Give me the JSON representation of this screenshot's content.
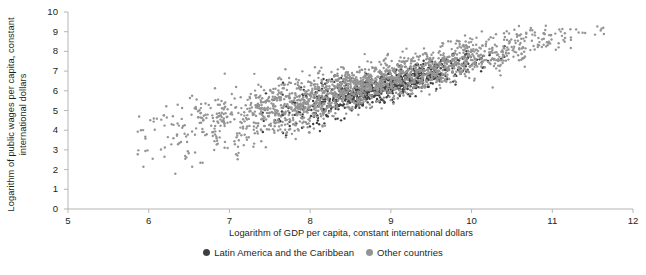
{
  "chart_data": {
    "type": "scatter",
    "title": "",
    "xlabel": "Logarithm of GDP per capita, constant international dollars",
    "ylabel": "Logarithm of public wages per capita, constant international dollars",
    "xlim": [
      5,
      12
    ],
    "ylim": [
      0,
      10
    ],
    "xticks": [
      5,
      6,
      7,
      8,
      9,
      10,
      11,
      12
    ],
    "yticks": [
      0,
      1,
      2,
      3,
      4,
      5,
      6,
      7,
      8,
      9,
      10
    ],
    "grid": false,
    "legend_position": "bottom-center",
    "marker_size_px": 2.4,
    "series": [
      {
        "name": "Latin America and the Caribbean",
        "color": "#3f3f3f",
        "n_points": 760,
        "x_range": [
          7.35,
          10.45
        ],
        "y_range": [
          3.7,
          8.3
        ],
        "trend_slope": 1.12,
        "trend_intercept": -3.75,
        "scatter_sd": 0.33,
        "x_mean": 8.85,
        "x_sd": 0.62
      },
      {
        "name": "Other countries",
        "color": "#949494",
        "n_points": 1850,
        "x_range": [
          5.85,
          11.8
        ],
        "y_range": [
          1.4,
          9.3
        ],
        "trend_slope": 1.05,
        "trend_intercept": -2.85,
        "scatter_sd": 0.52,
        "x_mean": 8.6,
        "x_sd": 1.25
      }
    ]
  },
  "axis": {
    "x_tick_labels": [
      "5",
      "6",
      "7",
      "8",
      "9",
      "10",
      "11",
      "12"
    ],
    "y_tick_labels": [
      "0",
      "1",
      "2",
      "3",
      "4",
      "5",
      "6",
      "7",
      "8",
      "9",
      "10"
    ],
    "x_title": "Logarithm of GDP per capita, constant international dollars",
    "y_title": "Logarithm of public wages per capita, constant international dollars",
    "axis_color": "#b5b5b5"
  },
  "legend": {
    "items": [
      {
        "label": "Latin America and the Caribbean",
        "color": "#3f3f3f"
      },
      {
        "label": "Other countries",
        "color": "#949494"
      }
    ]
  },
  "colors": {
    "latin_america": "#3f3f3f",
    "other_countries": "#949494",
    "axis": "#b5b5b5",
    "text": "#231f20",
    "background": "#ffffff"
  }
}
